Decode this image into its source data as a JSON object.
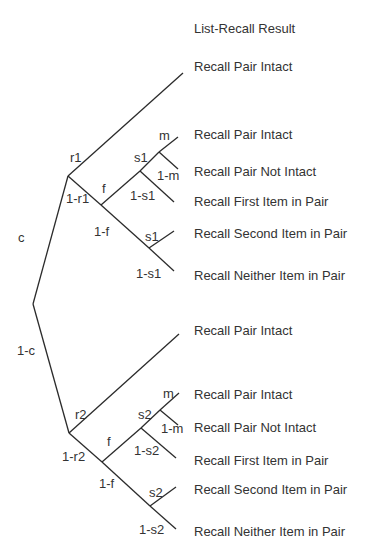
{
  "header": {
    "title": "List-Recall Result"
  },
  "root_branches": {
    "upper": "c",
    "lower": "1-c"
  },
  "subtree_upper": {
    "r": "r1",
    "not_r": "1-r1",
    "f": "f",
    "not_f": "1-f",
    "s_upper": "s1",
    "not_s_upper": "1-s1",
    "m": "m",
    "not_m": "1-m",
    "s_lower": "s1",
    "not_s_lower": "1-s1",
    "outcomes": [
      "Recall Pair Intact",
      "Recall Pair Intact",
      "Recall Pair Not Intact",
      "Recall First Item in Pair",
      "Recall Second Item in Pair",
      "Recall Neither Item in Pair"
    ]
  },
  "subtree_lower": {
    "r": "r2",
    "not_r": "1-r2",
    "f": "f",
    "not_f": "1-f",
    "s_upper": "s2",
    "not_s_upper": "1-s2",
    "m": "m",
    "not_m": "1-m",
    "s_lower": "s2",
    "not_s_lower": "1-s2",
    "outcomes": [
      "Recall Pair Intact",
      "Recall Pair Intact",
      "Recall Pair Not Intact",
      "Recall First Item in Pair",
      "Recall Second Item in Pair",
      "Recall Neither Item in Pair"
    ]
  },
  "colors": {
    "line": "#2b2b2b",
    "text": "#333333",
    "background": "#ffffff"
  }
}
